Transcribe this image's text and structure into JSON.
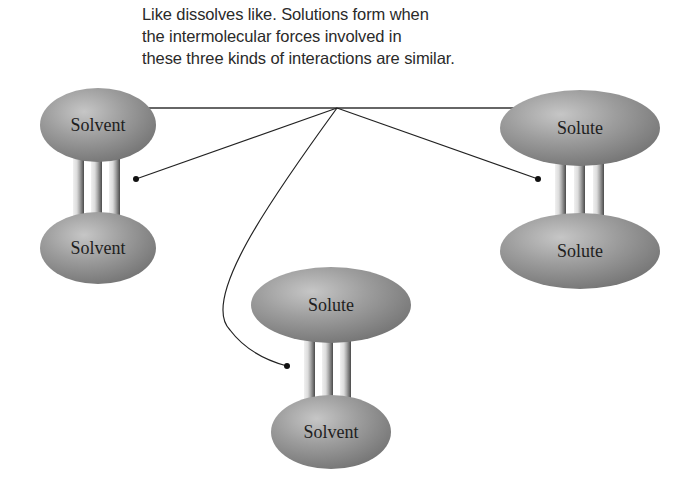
{
  "caption": {
    "lines": [
      "Like dissolves like. Solutions form when",
      "the intermolecular forces involved in",
      "these three kinds of interactions are similar."
    ]
  },
  "interactions": [
    {
      "name": "solvent-solvent",
      "top_label": "Solvent",
      "bottom_label": "Solvent"
    },
    {
      "name": "solute-solute",
      "top_label": "Solute",
      "bottom_label": "Solute"
    },
    {
      "name": "solute-solvent",
      "top_label": "Solute",
      "bottom_label": "Solvent"
    }
  ],
  "colors": {
    "ellipse_fill": "#9a9a9a",
    "ellipse_highlight": "#c4c4c4",
    "ellipse_shadow": "#6e6e6e",
    "bar_light": "#e6e6e6",
    "bar_dark": "#555555",
    "leader_line": "#222222",
    "text": "#1e1e1e"
  }
}
